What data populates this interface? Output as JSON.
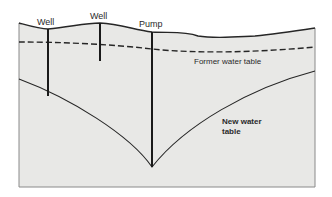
{
  "diagram": {
    "type": "cross-section",
    "labels": {
      "well_1": "Well",
      "well_2": "Well",
      "pump": "Pump",
      "former_water_table": "Former water table",
      "new_water_table_line1": "New water",
      "new_water_table_line2": "table"
    },
    "colors": {
      "ground_fill": "#e8e8e6",
      "line": "#262626",
      "border": "#8a8a8a",
      "text": "#2a2a2a"
    },
    "legend": {
      "former_water_table_style": "dashed",
      "new_water_table_style": "solid"
    }
  }
}
